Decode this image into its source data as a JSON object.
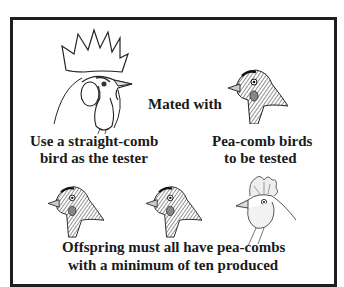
{
  "diagram": {
    "mating_label": "Mated with",
    "tester": {
      "line1": "Use a straight-comb",
      "line2": "bird as the tester",
      "illustration": "straight-comb-rooster-head-icon"
    },
    "tested": {
      "line1": "Pea-comb birds",
      "line2": "to be tested",
      "illustration": "pea-comb-hen-head-icon"
    },
    "offspring": {
      "line1": "Offspring must all have pea-combs",
      "line2": "with a minimum of ten produced",
      "illustrations": [
        "pea-comb-head-icon",
        "pea-comb-head-icon",
        "crested-head-icon"
      ]
    },
    "colors": {
      "border": "#1f1f1f",
      "text": "#1a1a1a",
      "background": "#ffffff"
    }
  }
}
